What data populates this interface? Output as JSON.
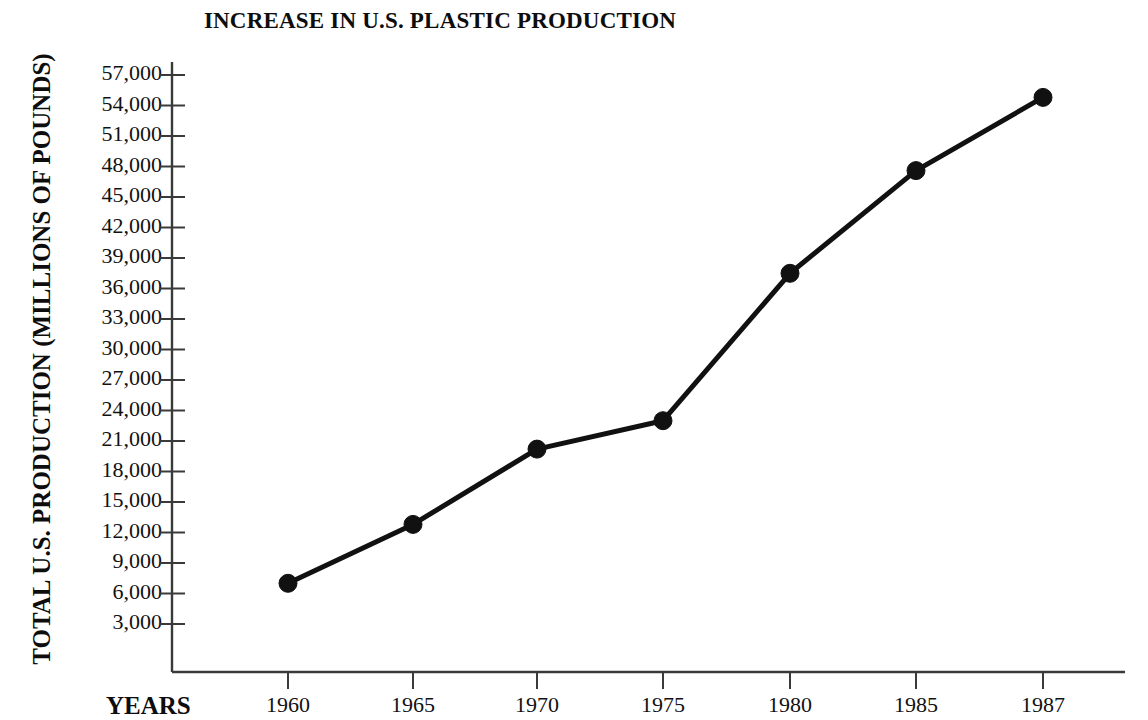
{
  "chart_data": {
    "type": "line",
    "title": "INCREASE IN U.S. PLASTIC PRODUCTION",
    "xlabel": "YEARS",
    "ylabel": "TOTAL U.S. PRODUCTION (MILLIONS OF POUNDS)",
    "categories": [
      "1960",
      "1965",
      "1970",
      "1975",
      "1980",
      "1985",
      "1987"
    ],
    "x": [
      1960,
      1965,
      1970,
      1975,
      1980,
      1985,
      1987
    ],
    "values": [
      7000,
      12800,
      20200,
      23000,
      37500,
      47600,
      54800
    ],
    "series": [
      {
        "name": "Total U.S. plastic production",
        "values": [
          7000,
          12800,
          20200,
          23000,
          37500,
          47600,
          54800
        ]
      }
    ],
    "ylim": [
      0,
      58500
    ],
    "ytick_labels": [
      "57,000",
      "54,000",
      "51,000",
      "48,000",
      "45,000",
      "42,000",
      "39,000",
      "36,000",
      "33,000",
      "30,000",
      "27,000",
      "24,000",
      "21,000",
      "18,000",
      "15,000",
      "12,000",
      "9,000",
      "6,000",
      "3,000"
    ],
    "ytick_values": [
      57000,
      54000,
      51000,
      48000,
      45000,
      42000,
      39000,
      36000,
      33000,
      30000,
      27000,
      24000,
      21000,
      18000,
      15000,
      12000,
      9000,
      6000,
      3000
    ],
    "grid": false,
    "legend": "none",
    "marker": "filled-circle",
    "line_color": "#111111",
    "marker_color": "#111111",
    "axis_color": "#3a3a3a",
    "background_color": "#ffffff",
    "annotations": []
  },
  "layout": {
    "plot_left_px": 172,
    "plot_bottom_px": 672,
    "plot_right_px": 1125,
    "plot_top_px": 62,
    "x_positions_px": [
      288,
      413,
      537,
      663,
      790,
      916,
      1043
    ],
    "y_tick_top_px": 75,
    "y_tick_step_px": 30.5
  }
}
